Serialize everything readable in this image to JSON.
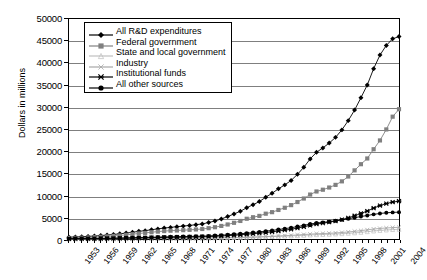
{
  "chart_data": {
    "type": "line",
    "title": "",
    "xlabel": "",
    "ylabel": "Dollars in millions",
    "ylim": [
      0,
      50000
    ],
    "ytick_values": [
      0,
      5000,
      10000,
      15000,
      20000,
      25000,
      30000,
      35000,
      40000,
      45000,
      50000
    ],
    "ytick_labels": [
      "0",
      "5000",
      "10000",
      "15000",
      "20000",
      "25000",
      "30000",
      "35000",
      "40000",
      "45000",
      "50000"
    ],
    "grid": true,
    "legend_position": "upper-left-inside",
    "x_start": 1953,
    "x_end": 2005,
    "xtick_labels": [
      "1953",
      "1956",
      "1959",
      "1962",
      "1965",
      "1968",
      "1971",
      "1974",
      "1977",
      "1980",
      "1983",
      "1986",
      "1989",
      "1992",
      "1995",
      "1998",
      "2001",
      "2004"
    ],
    "x": [
      1953,
      1954,
      1955,
      1956,
      1957,
      1958,
      1959,
      1960,
      1961,
      1962,
      1963,
      1964,
      1965,
      1966,
      1967,
      1968,
      1969,
      1970,
      1971,
      1972,
      1973,
      1974,
      1975,
      1976,
      1977,
      1978,
      1979,
      1980,
      1981,
      1982,
      1983,
      1984,
      1985,
      1986,
      1987,
      1988,
      1989,
      1990,
      1991,
      1992,
      1993,
      1994,
      1995,
      1996,
      1997,
      1998,
      1999,
      2000,
      2001,
      2002,
      2003,
      2004,
      2005
    ],
    "series": [
      {
        "name": "All R&D expenditures",
        "marker": "diamond",
        "color": "#000000",
        "values": [
          420,
          470,
          520,
          600,
          680,
          780,
          900,
          1030,
          1180,
          1350,
          1530,
          1740,
          1900,
          2100,
          2300,
          2480,
          2640,
          2790,
          2930,
          3080,
          3250,
          3430,
          3740,
          4100,
          4560,
          5100,
          5700,
          6300,
          7100,
          7800,
          8500,
          9500,
          10400,
          11400,
          12300,
          13300,
          14700,
          16300,
          18200,
          19700,
          20700,
          21800,
          23100,
          24800,
          26900,
          29300,
          32100,
          35000,
          38700,
          41800,
          44000,
          45500,
          46000
        ]
      },
      {
        "name": "Federal government",
        "marker": "square",
        "color": "#808080",
        "values": [
          230,
          260,
          300,
          360,
          420,
          500,
          600,
          700,
          810,
          940,
          1090,
          1260,
          1390,
          1540,
          1680,
          1800,
          1890,
          1940,
          2010,
          2080,
          2170,
          2270,
          2460,
          2680,
          2970,
          3300,
          3680,
          4100,
          4600,
          4950,
          5250,
          5750,
          6100,
          6600,
          7100,
          7700,
          8400,
          9200,
          10100,
          10800,
          11200,
          11700,
          12300,
          13100,
          14200,
          15600,
          17000,
          18300,
          20400,
          22400,
          24900,
          27800,
          29500
        ]
      },
      {
        "name": "State and local government",
        "marker": "triangle",
        "color": "#bfbfbf",
        "values": [
          25,
          28,
          31,
          35,
          40,
          46,
          52,
          60,
          68,
          77,
          87,
          98,
          108,
          120,
          132,
          143,
          152,
          161,
          170,
          180,
          192,
          205,
          225,
          248,
          274,
          304,
          335,
          370,
          410,
          445,
          480,
          520,
          560,
          610,
          660,
          710,
          770,
          840,
          920,
          990,
          1030,
          1080,
          1140,
          1210,
          1300,
          1400,
          1520,
          1660,
          1820,
          1950,
          2050,
          2150,
          2200
        ]
      },
      {
        "name": "Industry",
        "marker": "x",
        "color": "#a6a6a6",
        "values": [
          20,
          23,
          26,
          30,
          34,
          39,
          45,
          52,
          60,
          68,
          77,
          87,
          96,
          106,
          116,
          125,
          133,
          140,
          148,
          156,
          166,
          178,
          195,
          215,
          240,
          268,
          298,
          330,
          375,
          420,
          470,
          540,
          610,
          680,
          750,
          830,
          920,
          1020,
          1110,
          1190,
          1240,
          1300,
          1380,
          1480,
          1600,
          1740,
          1900,
          2080,
          2260,
          2400,
          2500,
          2600,
          2650
        ]
      },
      {
        "name": "Institutional funds",
        "marker": "star",
        "color": "#000000",
        "values": [
          60,
          68,
          76,
          86,
          98,
          112,
          128,
          147,
          168,
          192,
          218,
          246,
          272,
          300,
          330,
          358,
          382,
          404,
          426,
          450,
          478,
          508,
          558,
          615,
          684,
          766,
          858,
          955,
          1080,
          1200,
          1320,
          1480,
          1640,
          1820,
          2010,
          2220,
          2480,
          2780,
          3100,
          3400,
          3600,
          3820,
          4080,
          4400,
          4800,
          5280,
          5800,
          6350,
          7000,
          7600,
          8050,
          8400,
          8600
        ]
      },
      {
        "name": "All other sources",
        "marker": "circle",
        "color": "#000000",
        "values": [
          85,
          94,
          104,
          118,
          134,
          152,
          174,
          200,
          228,
          260,
          294,
          331,
          365,
          402,
          440,
          474,
          503,
          528,
          553,
          580,
          612,
          646,
          706,
          774,
          858,
          958,
          1068,
          1180,
          1325,
          1465,
          1595,
          1780,
          1955,
          2150,
          2350,
          2560,
          2820,
          3100,
          3400,
          3620,
          3780,
          3940,
          4130,
          4350,
          4600,
          4850,
          5100,
          5350,
          5600,
          5800,
          5950,
          6050,
          6100
        ]
      }
    ]
  }
}
